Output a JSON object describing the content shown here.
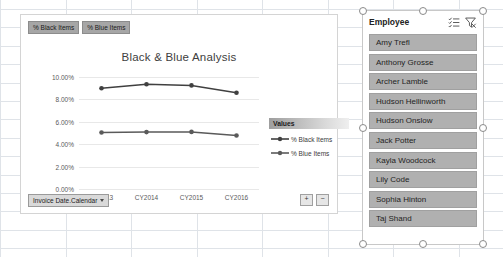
{
  "chart_object": {
    "title": "Black & Blue Analysis",
    "field_buttons": [
      {
        "label": "% Black Items"
      },
      {
        "label": "% Blue Items"
      }
    ],
    "axis_field_button": {
      "label": "Invoice Date.Calendar"
    },
    "expand_controls": {
      "plus": "+",
      "minus": "−"
    },
    "legend": {
      "header": "Values",
      "entries": [
        {
          "label": "% Black Items",
          "color": "#404040"
        },
        {
          "label": "% Blue Items",
          "color": "#5a5a5a"
        }
      ]
    }
  },
  "chart_data": {
    "type": "line",
    "title": "Black & Blue Analysis",
    "xlabel": "",
    "ylabel": "",
    "categories": [
      "CY2013",
      "CY2014",
      "CY2015",
      "CY2016"
    ],
    "x_tick_labels": [
      "CY2013",
      "CY2014",
      "CY2015",
      "CY2016"
    ],
    "y_tick_labels": [
      "0.00%",
      "2.00%",
      "4.00%",
      "6.00%",
      "8.00%",
      "10.00%"
    ],
    "ylim": [
      0,
      10
    ],
    "grid": true,
    "legend_position": "right",
    "series": [
      {
        "name": "% Black Items",
        "color": "#404040",
        "values": [
          9.0,
          9.35,
          9.25,
          8.6
        ]
      },
      {
        "name": "% Blue Items",
        "color": "#5a5a5a",
        "values": [
          5.05,
          5.08,
          5.1,
          4.78
        ]
      }
    ]
  },
  "slicer": {
    "title": "Employee",
    "icons": [
      {
        "name": "multi-select-icon"
      },
      {
        "name": "clear-filter-icon"
      }
    ],
    "items": [
      {
        "label": "Amy Trefl"
      },
      {
        "label": "Anthony Grosse"
      },
      {
        "label": "Archer Lamble"
      },
      {
        "label": "Hudson Hellinworth"
      },
      {
        "label": "Hudson Onslow"
      },
      {
        "label": "Jack Potter"
      },
      {
        "label": "Kayla Woodcock"
      },
      {
        "label": "Lily Code"
      },
      {
        "label": "Sophia Hinton"
      },
      {
        "label": "Taj Shand"
      }
    ]
  },
  "colors": {
    "slicer_item_bg": "#b0b0b0",
    "field_button_bg": "#a6a6a6",
    "grid_line": "#dfe3e8"
  }
}
